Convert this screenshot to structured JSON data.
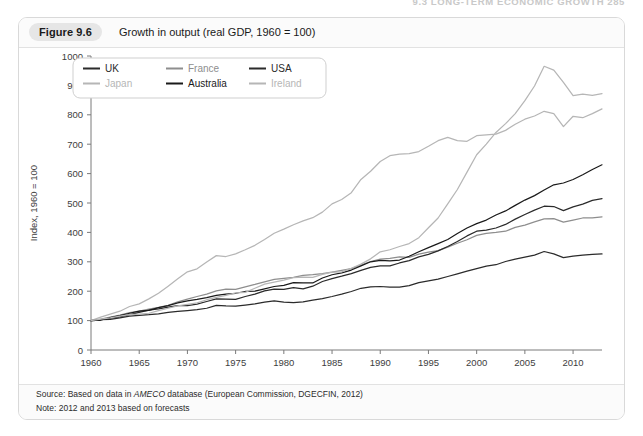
{
  "running_head": "9.3  LONG-TERM ECONOMIC GROWTH  285",
  "figure": {
    "badge": "Figure 9.6",
    "caption": "Growth in output (real GDP, 1960 = 100)"
  },
  "footer": {
    "source_prefix": "Source: Based on data in ",
    "source_italic": "AMECO",
    "source_suffix": " database (European Commission, DGECFIN, 2012)",
    "note": "Note: 2012 and 2013 based on forecasts"
  },
  "colors": {
    "uk": "#2b2b2b",
    "france": "#8e8e8e",
    "usa": "#2b2b2b",
    "japan": "#b6b6b6",
    "australia": "#1a1a1a",
    "ireland": "#b6b6b6",
    "axis": "#7a7a7a",
    "text": "#3d3d3d",
    "panel_border": "#d9d9d9",
    "badge_bg": "#e6e6e6"
  },
  "chart_data": {
    "type": "line",
    "title": "Growth in output (real GDP, 1960 = 100)",
    "xlabel": "",
    "ylabel": "Index, 1960 = 100",
    "xlim": [
      1960,
      2013
    ],
    "ylim": [
      0,
      1000
    ],
    "ytick_step": 100,
    "xtick_step": 5,
    "xticks": [
      1960,
      1965,
      1970,
      1975,
      1980,
      1985,
      1990,
      1995,
      2000,
      2005,
      2010
    ],
    "yticks": [
      0,
      100,
      200,
      300,
      400,
      500,
      600,
      700,
      800,
      900,
      1000
    ],
    "grid": false,
    "legend_position": "top-left",
    "x": [
      1960,
      1961,
      1962,
      1963,
      1964,
      1965,
      1966,
      1967,
      1968,
      1969,
      1970,
      1971,
      1972,
      1973,
      1974,
      1975,
      1976,
      1977,
      1978,
      1979,
      1980,
      1981,
      1982,
      1983,
      1984,
      1985,
      1986,
      1987,
      1988,
      1989,
      1990,
      1991,
      1992,
      1993,
      1994,
      1995,
      1996,
      1997,
      1998,
      1999,
      2000,
      2001,
      2002,
      2003,
      2004,
      2005,
      2006,
      2007,
      2008,
      2009,
      2010,
      2011,
      2012,
      2013
    ],
    "series": [
      {
        "name": "UK",
        "color": "#2b2b2b",
        "values": [
          100,
          103,
          104,
          109,
          115,
          118,
          120,
          123,
          128,
          131,
          134,
          137,
          142,
          152,
          150,
          149,
          153,
          157,
          163,
          167,
          163,
          161,
          164,
          170,
          175,
          182,
          190,
          199,
          210,
          215,
          216,
          214,
          214,
          219,
          229,
          235,
          241,
          250,
          259,
          268,
          277,
          285,
          290,
          301,
          309,
          316,
          323,
          335,
          327,
          314,
          319,
          323,
          325,
          327
        ]
      },
      {
        "name": "France",
        "color": "#8e8e8e",
        "values": [
          100,
          105,
          112,
          119,
          127,
          132,
          139,
          145,
          152,
          164,
          173,
          182,
          190,
          201,
          207,
          206,
          215,
          223,
          232,
          240,
          244,
          247,
          254,
          256,
          260,
          265,
          271,
          277,
          289,
          301,
          309,
          312,
          317,
          315,
          326,
          333,
          338,
          350,
          363,
          375,
          390,
          397,
          400,
          404,
          417,
          425,
          436,
          446,
          447,
          435,
          442,
          449,
          449,
          453
        ]
      },
      {
        "name": "USA",
        "color": "#2b2b2b",
        "values": [
          100,
          102,
          108,
          113,
          120,
          128,
          136,
          140,
          146,
          151,
          151,
          156,
          165,
          174,
          173,
          172,
          182,
          190,
          201,
          207,
          206,
          212,
          208,
          217,
          233,
          243,
          251,
          260,
          271,
          281,
          286,
          286,
          296,
          304,
          317,
          325,
          337,
          352,
          369,
          388,
          404,
          408,
          415,
          427,
          445,
          461,
          476,
          489,
          488,
          474,
          487,
          496,
          509,
          515
        ]
      },
      {
        "name": "Japan",
        "color": "#b6b6b6",
        "values": [
          100,
          112,
          122,
          132,
          148,
          157,
          174,
          193,
          217,
          242,
          266,
          276,
          299,
          321,
          318,
          327,
          341,
          356,
          376,
          397,
          411,
          426,
          439,
          450,
          469,
          497,
          512,
          535,
          580,
          608,
          641,
          661,
          666,
          668,
          675,
          693,
          712,
          723,
          712,
          710,
          729,
          732,
          734,
          747,
          768,
          785,
          796,
          812,
          804,
          760,
          795,
          790,
          804,
          820
        ]
      },
      {
        "name": "Australia",
        "color": "#1a1a1a",
        "values": [
          100,
          102,
          110,
          117,
          125,
          132,
          135,
          144,
          151,
          160,
          167,
          172,
          178,
          186,
          190,
          193,
          199,
          200,
          208,
          216,
          220,
          229,
          228,
          228,
          245,
          256,
          262,
          272,
          286,
          300,
          305,
          303,
          306,
          319,
          334,
          348,
          362,
          376,
          396,
          415,
          430,
          442,
          459,
          473,
          492,
          510,
          525,
          544,
          562,
          568,
          580,
          596,
          614,
          630
        ]
      },
      {
        "name": "Ireland",
        "color": "#b6b6b6",
        "values": [
          100,
          105,
          109,
          115,
          120,
          122,
          125,
          134,
          142,
          150,
          155,
          160,
          171,
          179,
          186,
          194,
          196,
          210,
          224,
          231,
          238,
          246,
          248,
          247,
          257,
          265,
          266,
          278,
          292,
          310,
          334,
          341,
          352,
          362,
          382,
          416,
          449,
          497,
          546,
          605,
          664,
          700,
          740,
          770,
          804,
          848,
          898,
          965,
          952,
          910,
          865,
          870,
          866,
          872
        ]
      }
    ],
    "legend": [
      {
        "label": "UK",
        "color": "#2b2b2b"
      },
      {
        "label": "France",
        "color": "#8e8e8e"
      },
      {
        "label": "USA",
        "color": "#2b2b2b"
      },
      {
        "label": "Japan",
        "color": "#b6b6b6"
      },
      {
        "label": "Australia",
        "color": "#1a1a1a"
      },
      {
        "label": "Ireland",
        "color": "#b6b6b6"
      }
    ]
  }
}
